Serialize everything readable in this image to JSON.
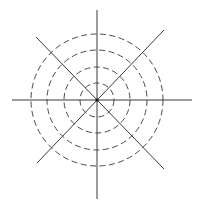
{
  "diagram": {
    "type": "polar-grid",
    "center": {
      "x": 97,
      "y": 100
    },
    "rings": [
      {
        "name": "ring-1",
        "radius": 17
      },
      {
        "name": "ring-2",
        "radius": 33
      },
      {
        "name": "ring-3",
        "radius": 50
      },
      {
        "name": "ring-4",
        "radius": 66
      }
    ],
    "lines": [
      {
        "name": "horizontal-axis",
        "x1": 12,
        "y1": 100,
        "x2": 192,
        "y2": 100
      },
      {
        "name": "vertical-axis",
        "x1": 97,
        "y1": 10,
        "x2": 97,
        "y2": 199
      },
      {
        "name": "diagonal-nw-se",
        "x1": 36,
        "y1": 37,
        "x2": 164,
        "y2": 169
      },
      {
        "name": "diagonal-ne-sw",
        "x1": 164,
        "y1": 30,
        "x2": 37,
        "y2": 163
      }
    ],
    "colors": {
      "line": "#3a3a3a",
      "ring": "#4a4a4a",
      "center": "#111111",
      "background": "#ffffff"
    }
  }
}
